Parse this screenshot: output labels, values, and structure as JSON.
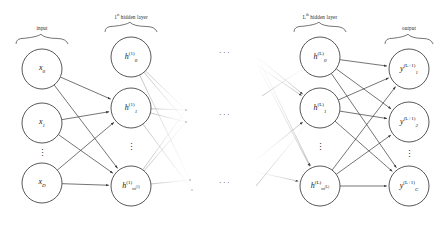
{
  "figure": {
    "type": "diagram",
    "stroke_color": "#3a3a3a",
    "faded_color": "#c8c8c8",
    "node_fill": "#ffffff",
    "text_color": "#111111"
  },
  "braces": [
    {
      "id": "input",
      "label": "input",
      "sup": "",
      "label_tail": "",
      "cx": 42,
      "y": 34,
      "half_width": 26
    },
    {
      "id": "hidden1",
      "label": "1",
      "sup": "st",
      "label_tail": " hidden layer",
      "cx": 131,
      "y": 22,
      "half_width": 26
    },
    {
      "id": "hiddenL",
      "label": "L",
      "sup": "th",
      "label_tail": " hidden layer",
      "cx": 320,
      "y": 22,
      "half_width": 26
    },
    {
      "id": "output",
      "label": "output",
      "sup": "",
      "label_tail": "",
      "cx": 409,
      "y": 34,
      "half_width": 24
    }
  ],
  "layers": [
    {
      "id": "input-layer",
      "name": "input",
      "cx": 42,
      "radius": 20,
      "nodes": [
        {
          "id": "x0",
          "base": "x",
          "sub": "0",
          "sub_sup": "",
          "sup": "",
          "cy": 69
        },
        {
          "id": "x1",
          "base": "x",
          "sub": "1",
          "sub_sup": "",
          "sup": "",
          "cy": 123
        },
        {
          "id": "xD",
          "base": "x",
          "sub": "D",
          "sub_sup": "",
          "sup": "",
          "cy": 183
        }
      ],
      "vdots": {
        "cx": 42,
        "cy": 153
      }
    },
    {
      "id": "hidden-layer-1",
      "name": "1st hidden layer",
      "cx": 131,
      "radius": 20,
      "nodes": [
        {
          "id": "h0_1",
          "base": "h",
          "sub": "0",
          "sub_sup": "",
          "sup": "(1)",
          "cy": 57
        },
        {
          "id": "h1_1",
          "base": "h",
          "sub": "1",
          "sub_sup": "",
          "sup": "(1)",
          "cy": 108
        },
        {
          "id": "hm_1",
          "base": "h",
          "sub": "m",
          "sub_sup": "(1)",
          "sup": "(1)",
          "cy": 186
        }
      ],
      "vdots": {
        "cx": 131,
        "cy": 147
      }
    },
    {
      "id": "hidden-layer-L",
      "name": "Lth hidden layer",
      "cx": 320,
      "radius": 20,
      "nodes": [
        {
          "id": "h0_L",
          "base": "h",
          "sub": "0",
          "sub_sup": "",
          "sup": "(L)",
          "cy": 57
        },
        {
          "id": "h1_L",
          "base": "h",
          "sub": "1",
          "sub_sup": "",
          "sup": "(L)",
          "cy": 108
        },
        {
          "id": "hm_L",
          "base": "h",
          "sub": "m",
          "sub_sup": "(L)",
          "sup": "(L)",
          "cy": 186
        }
      ],
      "vdots": {
        "cx": 320,
        "cy": 147
      }
    },
    {
      "id": "output-layer",
      "name": "output",
      "cx": 409,
      "radius": 20,
      "nodes": [
        {
          "id": "y1",
          "base": "y",
          "sub": "1",
          "sub_sup": "",
          "sup": "(L+1)",
          "cy": 69
        },
        {
          "id": "y2",
          "base": "y",
          "sub": "2",
          "sub_sup": "",
          "sup": "(L+1)",
          "cy": 122
        },
        {
          "id": "yC",
          "base": "y",
          "sub": "C",
          "sub_sup": "",
          "sup": "(L+1)",
          "cy": 186
        }
      ],
      "vdots": {
        "cx": 409,
        "cy": 154
      }
    }
  ],
  "gap_ellipses": [
    {
      "id": "gap-dots-top",
      "glyph": "···",
      "cx": 225,
      "cy": 52
    },
    {
      "id": "gap-dots-middle",
      "glyph": "···",
      "cx": 225,
      "cy": 114
    },
    {
      "id": "gap-dots-bottom",
      "glyph": "···",
      "cx": 225,
      "cy": 182
    }
  ],
  "edges": {
    "input_to_hidden1": [
      {
        "from": "x0",
        "to": "h1_1"
      },
      {
        "from": "x0",
        "to": "hm_1"
      },
      {
        "from": "x1",
        "to": "h1_1"
      },
      {
        "from": "x1",
        "to": "hm_1"
      },
      {
        "from": "xD",
        "to": "h1_1"
      },
      {
        "from": "xD",
        "to": "hm_1"
      }
    ],
    "hidden1_fade_out": [
      {
        "from": "h0_1"
      },
      {
        "from": "h1_1"
      },
      {
        "from": "hm_1"
      }
    ],
    "hiddenL_fade_in": [
      {
        "to": "h1_L"
      },
      {
        "to": "hm_L"
      }
    ],
    "hiddenL_to_output": [
      {
        "from": "h0_L",
        "to": "y1"
      },
      {
        "from": "h0_L",
        "to": "y2"
      },
      {
        "from": "h0_L",
        "to": "yC"
      },
      {
        "from": "h1_L",
        "to": "y1"
      },
      {
        "from": "h1_L",
        "to": "y2"
      },
      {
        "from": "h1_L",
        "to": "yC"
      },
      {
        "from": "hm_L",
        "to": "y1"
      },
      {
        "from": "hm_L",
        "to": "y2"
      },
      {
        "from": "hm_L",
        "to": "yC"
      }
    ]
  }
}
